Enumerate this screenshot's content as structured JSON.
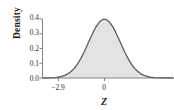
{
  "chart_data": {
    "type": "area",
    "title": "",
    "xlabel": "Z",
    "ylabel": "Density",
    "grid": false,
    "legend": null,
    "xlim": [
      -3.9,
      4.35
    ],
    "ylim": [
      0.0,
      0.42
    ],
    "x_ticks": [
      {
        "value": -2.9,
        "label": "−2.9"
      },
      {
        "value": 0,
        "label": "0"
      }
    ],
    "y_ticks": [
      {
        "value": 0.0,
        "label": "0.0"
      },
      {
        "value": 0.1,
        "label": "0.1"
      },
      {
        "value": 0.2,
        "label": "0.2"
      },
      {
        "value": 0.3,
        "label": "0.3"
      },
      {
        "value": 0.4,
        "label": "0.4"
      }
    ],
    "curve": {
      "name": "standard normal density",
      "mean": 0,
      "sd": 1,
      "peak_value": 0.4,
      "x": [
        -3.9,
        -3.7,
        -3.5,
        -3.3,
        -3.1,
        -2.9,
        -2.7,
        -2.5,
        -2.3,
        -2.1,
        -1.9,
        -1.7,
        -1.5,
        -1.3,
        -1.1,
        -0.9,
        -0.7,
        -0.5,
        -0.3,
        -0.1,
        0.1,
        0.3,
        0.5,
        0.7,
        0.9,
        1.1,
        1.3,
        1.5,
        1.7,
        1.9,
        2.1,
        2.3,
        2.5,
        2.7,
        2.9,
        3.1,
        3.3,
        3.5,
        3.7,
        3.9,
        4.1,
        4.35
      ],
      "y": [
        0.0002,
        0.0004,
        0.0009,
        0.0017,
        0.0033,
        0.006,
        0.0104,
        0.0175,
        0.0283,
        0.044,
        0.0656,
        0.094,
        0.1295,
        0.1714,
        0.2179,
        0.2661,
        0.3123,
        0.3521,
        0.3814,
        0.397,
        0.397,
        0.3814,
        0.3521,
        0.3123,
        0.2661,
        0.2179,
        0.1714,
        0.1295,
        0.094,
        0.0656,
        0.044,
        0.0283,
        0.0175,
        0.0104,
        0.006,
        0.0033,
        0.0017,
        0.0009,
        0.0004,
        0.0002,
        0.0001,
        0.0
      ]
    },
    "shaded_region": {
      "description": "area under the normal curve to the right of z = -2.9",
      "from": -2.9,
      "to": 4.35,
      "fill_color": "#e3e3e3",
      "boundary_line_at": -2.9
    },
    "colors": {
      "curve_stroke": "#595959",
      "axis": "#767676",
      "text": "#2b2b2b",
      "background": "#ffffff"
    }
  }
}
